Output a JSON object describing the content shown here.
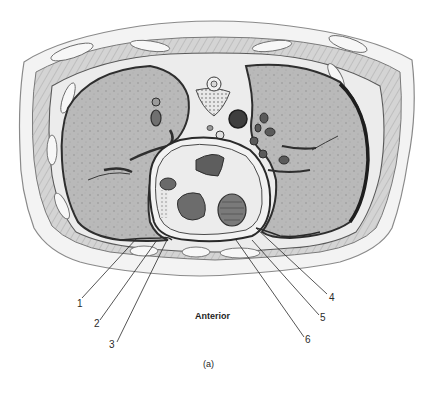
{
  "figure": {
    "orientation_label": "Anterior",
    "panel_caption": "(a)",
    "colors": {
      "background": "#ffffff",
      "lung_tissue": "#b4b4b4",
      "outline": "#3a3a3a",
      "soft_tissue": "#e6e6e6",
      "cavity_dark": "#4a4a4a"
    },
    "labels": [
      {
        "id": "1",
        "text": "1",
        "x": 79,
        "y": 299
      },
      {
        "id": "2",
        "text": "2",
        "x": 96,
        "y": 319
      },
      {
        "id": "3",
        "text": "3",
        "x": 111,
        "y": 340
      },
      {
        "id": "4",
        "text": "4",
        "x": 331,
        "y": 293
      },
      {
        "id": "5",
        "text": "5",
        "x": 322,
        "y": 313
      },
      {
        "id": "6",
        "text": "6",
        "x": 307,
        "y": 335
      }
    ]
  }
}
